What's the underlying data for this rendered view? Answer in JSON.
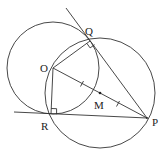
{
  "diagram": {
    "stroke_color": "#333333",
    "points": {
      "O": {
        "label": "O",
        "x": 53,
        "y": 68,
        "label_x": 40,
        "label_y": 72
      },
      "Q": {
        "label": "Q",
        "x": 90,
        "y": 41,
        "label_x": 85,
        "label_y": 35
      },
      "R": {
        "label": "R",
        "x": 51,
        "y": 114,
        "label_x": 41,
        "label_y": 130
      },
      "P": {
        "label": "P",
        "x": 147,
        "y": 118,
        "label_x": 152,
        "label_y": 126
      },
      "M": {
        "label": "M",
        "x": 100,
        "y": 93,
        "label_x": 94,
        "label_y": 109
      }
    },
    "circles": [
      {
        "name": "circle-centered-O",
        "cx": 53,
        "cy": 68,
        "r": 46
      },
      {
        "name": "circle-centered-M",
        "cx": 100,
        "cy": 93,
        "r": 55
      }
    ],
    "lines": [
      {
        "name": "tangent-PQ",
        "x1": 66,
        "y1": 8,
        "x2": 147,
        "y2": 118
      },
      {
        "name": "tangent-PR",
        "x1": 14,
        "y1": 112,
        "x2": 147,
        "y2": 118
      },
      {
        "name": "segment-OQ",
        "x1": 53,
        "y1": 68,
        "x2": 90,
        "y2": 41
      },
      {
        "name": "segment-OR",
        "x1": 53,
        "y1": 68,
        "x2": 51,
        "y2": 114
      },
      {
        "name": "segment-OP",
        "x1": 53,
        "y1": 68,
        "x2": 147,
        "y2": 118
      }
    ],
    "tick_marks": [
      {
        "name": "tick-OM",
        "x": 82,
        "y": 84
      },
      {
        "name": "tick-MP",
        "x": 118,
        "y": 104
      }
    ]
  }
}
